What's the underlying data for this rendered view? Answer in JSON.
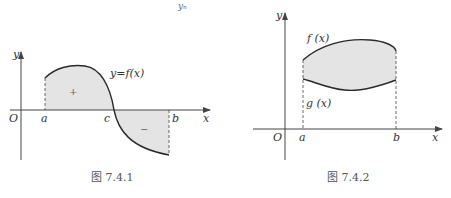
{
  "header_fragment": "yₙ",
  "figures": [
    {
      "caption": "图 7.4.1",
      "labels": {
        "y_axis": "y",
        "x_axis": "x",
        "origin": "O",
        "a": "a",
        "c": "c",
        "b": "b",
        "curve": "y=f(x)",
        "positive": "+",
        "negative": "−"
      }
    },
    {
      "caption": "图 7.4.2",
      "labels": {
        "y_axis": "y",
        "x_axis": "x",
        "origin": "O",
        "a": "a",
        "b": "b",
        "upper": "f (x)",
        "lower": "g (x)"
      }
    }
  ],
  "colors": {
    "shade": "#e4e4e4",
    "curve": "#2a2a2a",
    "axis": "#444444"
  }
}
